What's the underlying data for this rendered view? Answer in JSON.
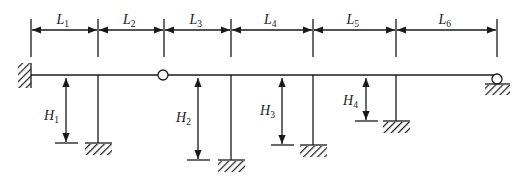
{
  "diagram": {
    "colors": {
      "stroke": "#1a1a1a",
      "background": "#ffffff"
    },
    "beam": {
      "y": 75,
      "x_start": 31,
      "x_end": 497
    },
    "left_support": {
      "type": "fixed",
      "x": 31,
      "y_top": 63,
      "y_bottom": 88,
      "width": 13
    },
    "hinge": {
      "type": "internal-hinge",
      "cx": 163,
      "cy": 75,
      "r": 5
    },
    "right_support": {
      "type": "roller",
      "cx": 497,
      "cy": 79,
      "r": 5,
      "hatch_y": 84,
      "hatch_x1": 485,
      "hatch_x2": 510
    },
    "span_dimensions": {
      "dim_y": 30,
      "ext_top": 19,
      "ext_bottom": 57,
      "ticks": [
        31,
        98,
        164,
        231,
        313,
        396,
        497
      ],
      "labels": [
        {
          "main": "L",
          "sub": "1"
        },
        {
          "main": "L",
          "sub": "2"
        },
        {
          "main": "L",
          "sub": "3"
        },
        {
          "main": "L",
          "sub": "4"
        },
        {
          "main": "L",
          "sub": "5"
        },
        {
          "main": "L",
          "sub": "6"
        }
      ]
    },
    "columns": [
      {
        "x": 98,
        "base_y": 143,
        "dim_x": 66,
        "label": {
          "main": "H",
          "sub": "1"
        },
        "label_x": 44,
        "label_y": 120
      },
      {
        "x": 231,
        "base_y": 160,
        "dim_x": 198,
        "label": {
          "main": "H",
          "sub": "2"
        },
        "label_x": 176,
        "label_y": 122
      },
      {
        "x": 313,
        "base_y": 145,
        "dim_x": 282,
        "label": {
          "main": "H",
          "sub": "3"
        },
        "label_x": 260,
        "label_y": 115
      },
      {
        "x": 396,
        "base_y": 121,
        "dim_x": 366,
        "label": {
          "main": "H",
          "sub": "4"
        },
        "label_x": 343,
        "label_y": 105
      }
    ]
  }
}
